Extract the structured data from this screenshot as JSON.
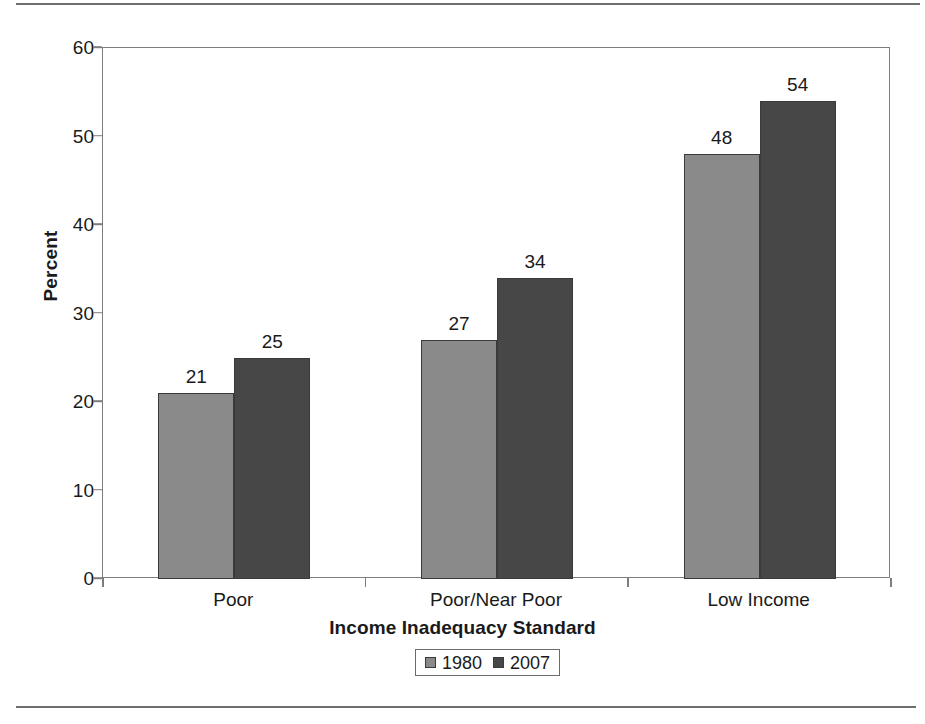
{
  "chart_data": {
    "type": "bar",
    "title": "",
    "subtitle": "",
    "xlabel": "Income Inadequacy Standard",
    "ylabel": "Percent",
    "categories": [
      "Poor",
      "Poor/Near Poor",
      "Low Income"
    ],
    "series": [
      {
        "name": "1980",
        "color": "#8a8a8a",
        "values": [
          21,
          27,
          48
        ]
      },
      {
        "name": "2007",
        "color": "#474747",
        "values": [
          25,
          34,
          54
        ]
      }
    ],
    "ylim": [
      0,
      60
    ],
    "yticks": [
      0,
      10,
      20,
      30,
      40,
      50,
      60
    ],
    "ytick_labels": [
      "0",
      "10",
      "20",
      "30",
      "40",
      "50",
      "60"
    ],
    "grid": false,
    "legend_position": "bottom",
    "data_labels": [
      [
        "21",
        "25"
      ],
      [
        "27",
        "34"
      ],
      [
        "48",
        "54"
      ]
    ]
  },
  "axes": {
    "y_label": "Percent",
    "x_label": "Income Inadequacy Standard"
  },
  "legend": {
    "entries": [
      {
        "label": "1980"
      },
      {
        "label": "2007"
      }
    ]
  },
  "colors": {
    "series_1980": "#8a8a8a",
    "series_2007": "#474747",
    "frame": "#7d7d7d",
    "rule": "#6e6e6e",
    "text": "#1a1a1a"
  }
}
